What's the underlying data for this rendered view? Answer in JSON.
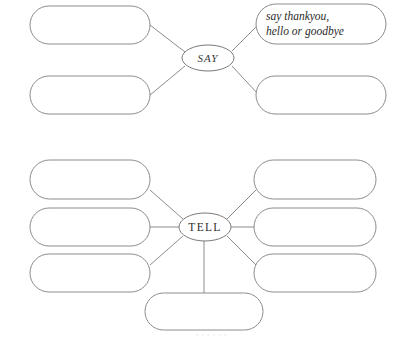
{
  "diagram": {
    "type": "mind-map",
    "background_color": "#ffffff",
    "stroke_color": "#8e8c8a",
    "text_color": "#2b2b2b",
    "clusters": [
      {
        "id": "say",
        "hub_label": "SAY",
        "hub": {
          "cx": 208,
          "cy": 58,
          "rx": 26,
          "ry": 13
        },
        "nodes": [
          {
            "id": "say-left-top",
            "label": "",
            "x": 30,
            "y": 6,
            "w": 120,
            "h": 38,
            "link_from": "right",
            "anchor_x": 150,
            "anchor_y": 25
          },
          {
            "id": "say-left-bottom",
            "label": "",
            "x": 30,
            "y": 76,
            "w": 120,
            "h": 38,
            "link_from": "right",
            "anchor_x": 150,
            "anchor_y": 95
          },
          {
            "id": "say-right-top",
            "label": "say thankyou,\nhello or goodbye",
            "x": 256,
            "y": 4,
            "w": 130,
            "h": 40,
            "link_from": "left",
            "anchor_x": 256,
            "anchor_y": 24
          },
          {
            "id": "say-right-bottom",
            "label": "",
            "x": 256,
            "y": 76,
            "w": 130,
            "h": 38,
            "link_from": "left",
            "anchor_x": 256,
            "anchor_y": 95
          }
        ]
      },
      {
        "id": "tell",
        "hub_label": "TELL",
        "hub": {
          "cx": 205,
          "cy": 227,
          "rx": 26,
          "ry": 14
        },
        "nodes": [
          {
            "id": "tell-left-top",
            "label": "",
            "x": 30,
            "y": 160,
            "w": 120,
            "h": 39,
            "link_from": "right",
            "anchor_x": 150,
            "anchor_y": 190
          },
          {
            "id": "tell-left-middle",
            "label": "",
            "x": 30,
            "y": 208,
            "w": 120,
            "h": 38,
            "link_from": "right",
            "anchor_x": 150,
            "anchor_y": 227
          },
          {
            "id": "tell-left-bottom",
            "label": "",
            "x": 30,
            "y": 254,
            "w": 120,
            "h": 38,
            "link_from": "right",
            "anchor_x": 150,
            "anchor_y": 265
          },
          {
            "id": "tell-right-top",
            "label": "",
            "x": 254,
            "y": 160,
            "w": 122,
            "h": 39,
            "link_from": "left",
            "anchor_x": 254,
            "anchor_y": 190
          },
          {
            "id": "tell-right-middle",
            "label": "",
            "x": 254,
            "y": 208,
            "w": 122,
            "h": 38,
            "link_from": "left",
            "anchor_x": 254,
            "anchor_y": 227
          },
          {
            "id": "tell-right-bottom",
            "label": "",
            "x": 254,
            "y": 254,
            "w": 122,
            "h": 38,
            "link_from": "left",
            "anchor_x": 254,
            "anchor_y": 265
          },
          {
            "id": "tell-bottom",
            "label": "",
            "x": 145,
            "y": 293,
            "w": 118,
            "h": 37,
            "link_from": "top",
            "anchor_x": 204,
            "anchor_y": 293
          }
        ]
      }
    ],
    "artifact_text": "•  •     •   •  •      •"
  }
}
